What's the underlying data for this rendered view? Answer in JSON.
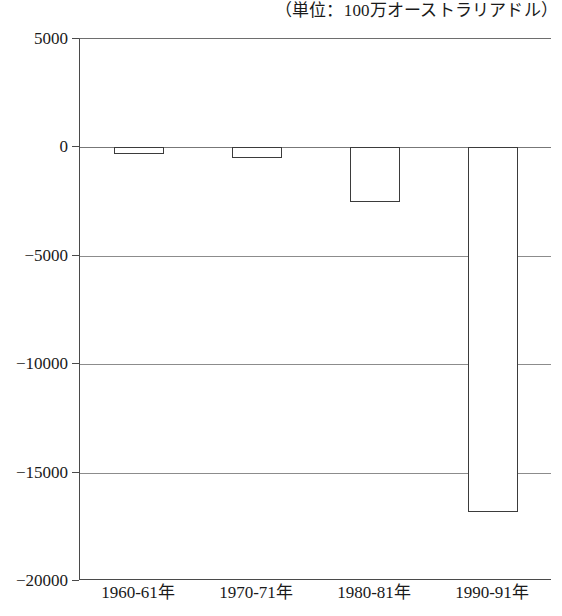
{
  "chart_data": {
    "type": "bar",
    "title": "（単位：100万オーストラリアドル）",
    "xlabel": "",
    "ylabel": "",
    "categories": [
      "1960-61年",
      "1970-71年",
      "1980-81年",
      "1990-91年"
    ],
    "values": [
      -320,
      -500,
      -2500,
      -16800
    ],
    "series": [
      {
        "name": "",
        "values": [
          -320,
          -500,
          -2500,
          -16800
        ]
      }
    ],
    "ylim": [
      -20000,
      5000
    ],
    "yticks": [
      5000,
      0,
      -5000,
      -10000,
      -15000,
      -20000
    ],
    "ytick_labels": [
      "5000",
      "0",
      "−5000",
      "−10000",
      "−15000",
      "−20000"
    ],
    "grid": true,
    "legend": "none",
    "bar_fill": "#ffffff",
    "bar_edge": "#3b3b3b",
    "axis_color": "#4a4a4a",
    "grid_color": "#8c8c8c"
  }
}
